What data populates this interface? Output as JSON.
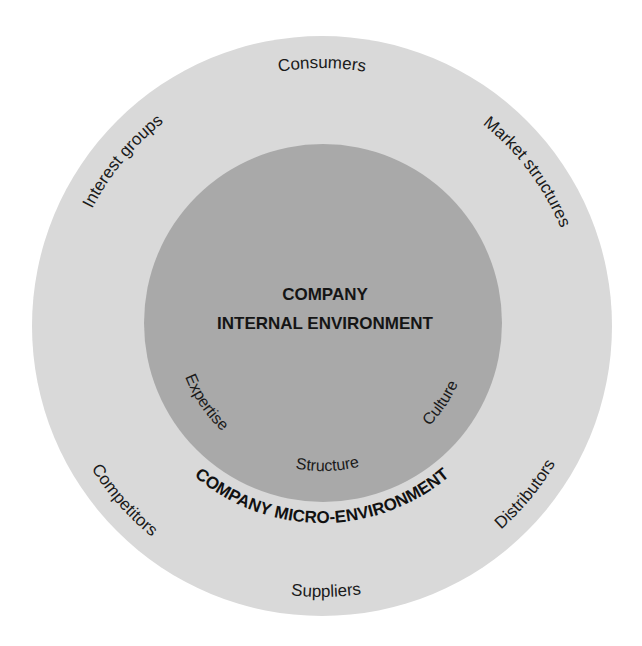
{
  "diagram": {
    "colors": {
      "background": "#ffffff",
      "outer_ring": "#d9d9d9",
      "inner_circle": "#a9a9a9",
      "text": "#1a1a1a"
    },
    "inner_circle": {
      "title_line1": "COMPANY",
      "title_line2": "INTERNAL ENVIRONMENT",
      "labels": {
        "expertise": "Expertise",
        "structure": "Structure",
        "culture": "Culture"
      }
    },
    "outer_ring": {
      "title": "COMPANY MICRO-ENVIRONMENT",
      "labels": {
        "consumers": "Consumers",
        "market_structures": "Market structures",
        "distributors": "Distributors",
        "suppliers": "Suppliers",
        "competitors": "Competitors",
        "interest_groups": "Interest groups"
      }
    }
  }
}
